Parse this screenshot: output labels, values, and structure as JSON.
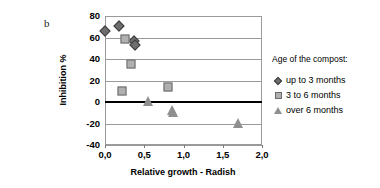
{
  "panel": {
    "letter": "b"
  },
  "legend": {
    "title": "Age of the compost:",
    "items": [
      {
        "label": "up to 3 months",
        "marker": "diamond-icon",
        "color": "#6e6e6e"
      },
      {
        "label": "3 to 6 months",
        "marker": "square-icon",
        "color": "#b0b0b0"
      },
      {
        "label": "over 6 months",
        "marker": "triangle-icon",
        "color": "#8f8f8f"
      }
    ]
  },
  "chart_data": {
    "type": "scatter",
    "title": "",
    "xlabel": "Relative growth - Radish",
    "ylabel": "Inhibition %",
    "xlim": [
      0.0,
      2.0
    ],
    "ylim": [
      -40,
      80
    ],
    "xticks": [
      0.0,
      0.5,
      1.0,
      1.5,
      2.0
    ],
    "xtick_labels": [
      "0,0",
      "0,5",
      "1,0",
      "1,5",
      "2,0"
    ],
    "yticks": [
      -40,
      -20,
      0,
      20,
      40,
      60,
      80
    ],
    "ytick_labels": [
      "-40",
      "-20",
      "0",
      "20",
      "40",
      "60",
      "80"
    ],
    "grid": "horizontal",
    "zero_line": true,
    "legend_position": "right",
    "series": [
      {
        "name": "up to 3 months",
        "marker": "diamond",
        "color": "#6e6e6e",
        "points": [
          {
            "x": 0.0,
            "y": 66
          },
          {
            "x": 0.18,
            "y": 71
          },
          {
            "x": 0.37,
            "y": 57
          },
          {
            "x": 0.38,
            "y": 53
          }
        ]
      },
      {
        "name": "3 to 6 months",
        "marker": "square",
        "color": "#b0b0b0",
        "points": [
          {
            "x": 0.26,
            "y": 59
          },
          {
            "x": 0.33,
            "y": 35
          },
          {
            "x": 0.22,
            "y": 10
          },
          {
            "x": 0.8,
            "y": 14
          }
        ]
      },
      {
        "name": "over 6 months",
        "marker": "triangle",
        "color": "#8f8f8f",
        "points": [
          {
            "x": 0.55,
            "y": 0
          },
          {
            "x": 0.85,
            "y": -8
          },
          {
            "x": 0.87,
            "y": -10
          },
          {
            "x": 1.7,
            "y": -20
          }
        ]
      }
    ]
  }
}
